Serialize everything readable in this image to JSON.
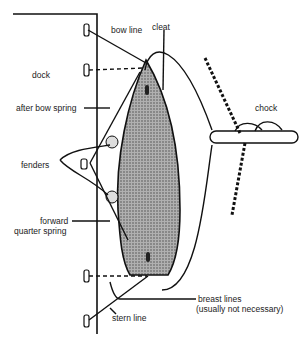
{
  "labels": {
    "bow_line": "bow line",
    "cleat": "cleat",
    "dock": "dock",
    "after_bow_spring": "after bow spring",
    "chock": "chock",
    "fenders": "fenders",
    "forward_quarter_spring_1": "forward",
    "forward_quarter_spring_2": "quarter spring",
    "breast_lines_1": "breast lines",
    "breast_lines_2": "(usually not necessary)",
    "stern_line": "stern line"
  },
  "colors": {
    "line": "#111111",
    "hull": "#9a9a9a"
  }
}
